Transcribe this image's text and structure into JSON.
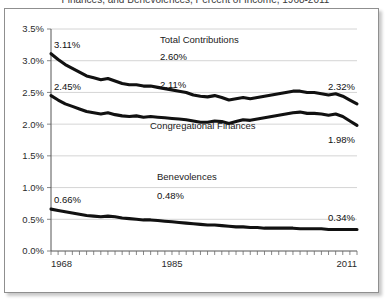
{
  "title": "Finances, and Benevolences, Percent of Income, 1968-2011",
  "chart_data": {
    "type": "line",
    "title": "Finances, and Benevolences, Percent of Income, 1968-2011",
    "xlabel": "",
    "ylabel": "",
    "xlim": [
      1968,
      2011
    ],
    "ylim": [
      0.0,
      3.5
    ],
    "grid": true,
    "legend": "inline-annotations",
    "y_ticks": [
      "0.0%",
      "0.5%",
      "1.0%",
      "1.5%",
      "2.0%",
      "2.5%",
      "3.0%",
      "3.5%"
    ],
    "y_tick_values": [
      0.0,
      0.5,
      1.0,
      1.5,
      2.0,
      2.5,
      3.0,
      3.5
    ],
    "x_ticks": [
      "1968",
      "1985",
      "2011"
    ],
    "x_tick_values": [
      1968,
      1985,
      2011
    ],
    "x": [
      1968,
      1969,
      1970,
      1971,
      1972,
      1973,
      1974,
      1975,
      1976,
      1977,
      1978,
      1979,
      1980,
      1981,
      1982,
      1983,
      1984,
      1985,
      1986,
      1987,
      1988,
      1989,
      1990,
      1991,
      1992,
      1993,
      1994,
      1995,
      1996,
      1997,
      1998,
      1999,
      2000,
      2001,
      2002,
      2003,
      2004,
      2005,
      2006,
      2007,
      2008,
      2009,
      2010,
      2011
    ],
    "series": [
      {
        "name": "Total Contributions",
        "values": [
          3.11,
          3.02,
          2.94,
          2.88,
          2.82,
          2.76,
          2.73,
          2.7,
          2.72,
          2.68,
          2.64,
          2.62,
          2.62,
          2.6,
          2.6,
          2.58,
          2.56,
          2.54,
          2.52,
          2.5,
          2.46,
          2.44,
          2.43,
          2.45,
          2.42,
          2.38,
          2.4,
          2.42,
          2.4,
          2.42,
          2.44,
          2.46,
          2.48,
          2.5,
          2.52,
          2.52,
          2.5,
          2.5,
          2.48,
          2.46,
          2.48,
          2.44,
          2.38,
          2.32
        ],
        "start_label": "3.11%",
        "mid_label": "2.60%",
        "end_label": "2.32%"
      },
      {
        "name": "Congregational Finances",
        "values": [
          2.45,
          2.38,
          2.32,
          2.28,
          2.24,
          2.2,
          2.18,
          2.16,
          2.18,
          2.15,
          2.13,
          2.12,
          2.13,
          2.11,
          2.12,
          2.11,
          2.1,
          2.09,
          2.08,
          2.07,
          2.05,
          2.03,
          2.03,
          2.05,
          2.04,
          2.01,
          2.04,
          2.07,
          2.06,
          2.08,
          2.1,
          2.12,
          2.14,
          2.16,
          2.18,
          2.19,
          2.17,
          2.17,
          2.16,
          2.14,
          2.16,
          2.12,
          2.05,
          1.98
        ],
        "start_label": "2.45%",
        "mid_label": "2.11%",
        "end_label": "1.98%"
      },
      {
        "name": "Benevolences",
        "values": [
          0.66,
          0.64,
          0.62,
          0.6,
          0.58,
          0.56,
          0.55,
          0.54,
          0.55,
          0.54,
          0.52,
          0.51,
          0.5,
          0.49,
          0.49,
          0.48,
          0.47,
          0.46,
          0.45,
          0.44,
          0.43,
          0.42,
          0.41,
          0.41,
          0.4,
          0.39,
          0.38,
          0.38,
          0.37,
          0.37,
          0.36,
          0.36,
          0.36,
          0.36,
          0.36,
          0.35,
          0.35,
          0.35,
          0.35,
          0.34,
          0.34,
          0.34,
          0.34,
          0.34
        ],
        "start_label": "0.66%",
        "mid_label": "0.48%",
        "end_label": "0.34%"
      }
    ],
    "annotations": [
      {
        "text": "Total Contributions",
        "series": "Total Contributions"
      },
      {
        "text": "Congregational Finances",
        "series": "Congregational Finances"
      },
      {
        "text": "Benevolences",
        "series": "Benevolences"
      }
    ]
  }
}
